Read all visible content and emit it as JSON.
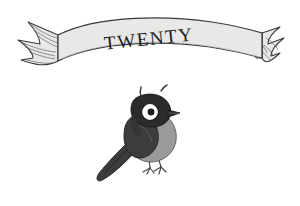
{
  "page": {
    "kind": "book-chapter-opener-illustration",
    "background_color": "#ffffff"
  },
  "banner": {
    "name": "ribbon-banner",
    "title_text": "TWENTY",
    "fill_color": "#e8e8e6",
    "outline_color": "#3a3a3a",
    "hatch_color": "#555555",
    "text_color": "#1c1c1c",
    "text_rotation_deg": -6,
    "style": "swallowtail ribbon with hatched forked ends"
  },
  "illustration": {
    "name": "startled-bird",
    "subject": "bird",
    "expression": "startled",
    "pose": "perched, facing right, tail sweeping to lower left",
    "body_color": "#9a9a98",
    "wing_color": "#3c3c3c",
    "head_color": "#2b2b2b",
    "eye_white_color": "#ffffff",
    "pupil_color": "#1a1a1a",
    "beak_color": "#2b2b2b",
    "leg_color": "#4a4a4a",
    "surprise_marks": 2,
    "medium": "ink and grey wash"
  }
}
